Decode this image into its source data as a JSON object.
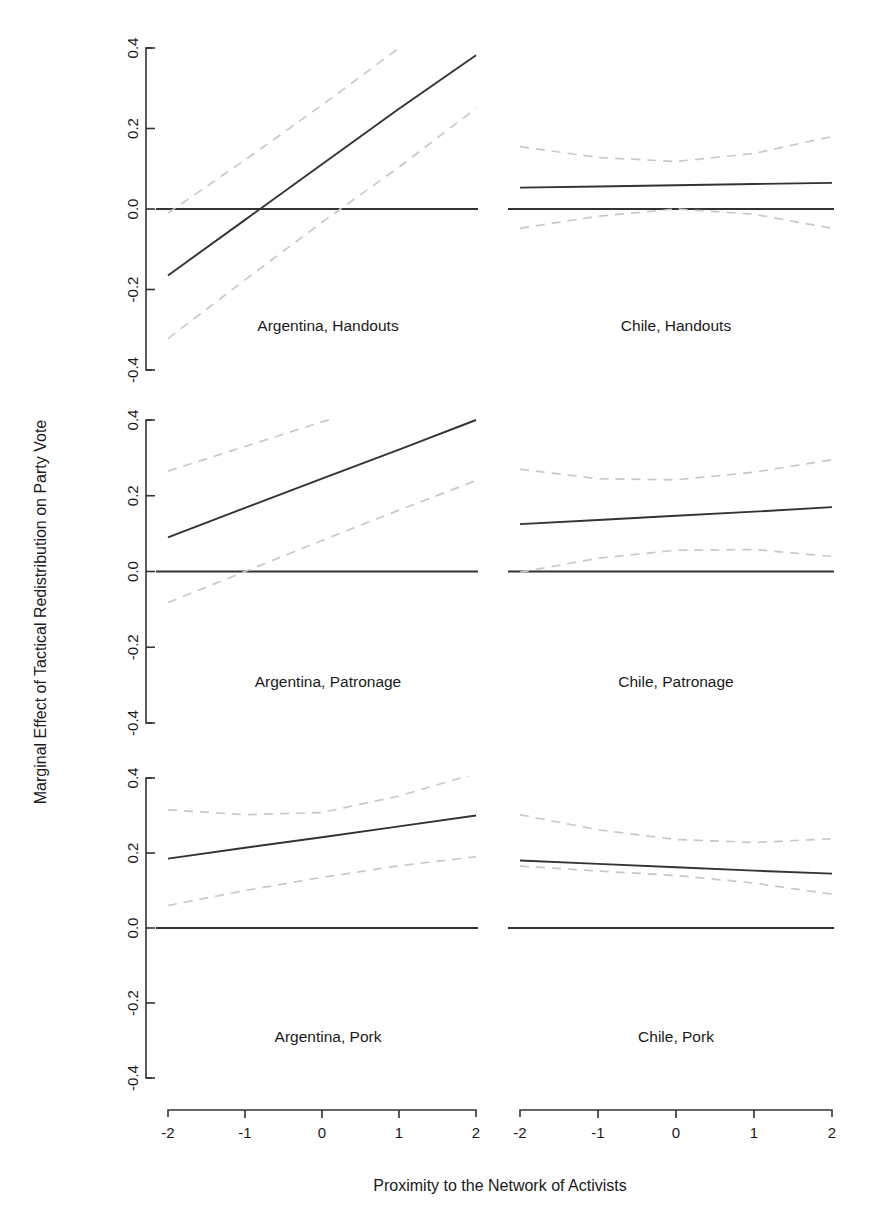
{
  "figure": {
    "axis_titles": {
      "y": "Marginal Effect of Tactical Redistribution on Party Vote",
      "x": "Proximity to the Network of Activists"
    },
    "y_tick_labels": [
      "0.4",
      "0.2",
      "0.0",
      "-0.2",
      "-0.4"
    ],
    "x_tick_labels": [
      "-2",
      "-1",
      "0",
      "1",
      "2"
    ],
    "colors": {
      "line": "#333333",
      "ci": "#c9c9c9",
      "axis": "#333333",
      "background": "#ffffff",
      "text": "#1a1a1a"
    },
    "panel_labels": [
      "Argentina, Handouts",
      "Chile, Handouts",
      "Argentina, Patronage",
      "Chile, Patronage",
      "Argentina, Pork",
      "Chile, Pork"
    ]
  },
  "chart_data": {
    "type": "line",
    "title": "",
    "xlabel": "Proximity to the Network of Activists",
    "ylabel": "Marginal Effect of Tactical Redistribution on Party Vote",
    "xlim": [
      -2,
      2
    ],
    "ylim": [
      -0.4,
      0.4
    ],
    "xticks": [
      -2,
      -1,
      0,
      1,
      2
    ],
    "yticks": [
      -0.4,
      -0.2,
      0.0,
      0.2,
      0.4
    ],
    "grid": false,
    "legend": "none",
    "layout": "3 rows x 2 columns of panels",
    "annotations": [
      "solid line = marginal effect estimate",
      "dashed light-grey lines = 95% confidence interval",
      "solid horizontal line at y = 0 = null reference"
    ],
    "panels": [
      {
        "label": "Argentina, Handouts",
        "row": 1,
        "col": 1,
        "x": [
          -2,
          -1,
          0,
          1,
          2
        ],
        "estimate": [
          -0.165,
          -0.027,
          0.111,
          0.249,
          0.382
        ],
        "ci_upper": [
          -0.01,
          0.122,
          0.258,
          0.4,
          0.545
        ],
        "ci_lower": [
          -0.322,
          -0.176,
          -0.033,
          0.104,
          0.25
        ],
        "zero_crossing": -0.85
      },
      {
        "label": "Chile, Handouts",
        "row": 1,
        "col": 2,
        "x": [
          -2,
          -1,
          0,
          1,
          2
        ],
        "estimate": [
          0.053,
          0.056,
          0.059,
          0.062,
          0.065
        ],
        "ci_upper": [
          0.155,
          0.128,
          0.118,
          0.138,
          0.18
        ],
        "ci_lower": [
          -0.048,
          -0.018,
          0.0,
          -0.013,
          -0.048
        ]
      },
      {
        "label": "Argentina, Patronage",
        "row": 2,
        "col": 1,
        "x": [
          -2,
          -1,
          0,
          1,
          2
        ],
        "estimate": [
          0.09,
          0.168,
          0.245,
          0.322,
          0.4
        ],
        "ci_upper": [
          0.265,
          0.33,
          0.395,
          0.458,
          0.522
        ],
        "ci_lower": [
          -0.082,
          0.0,
          0.082,
          0.162,
          0.24
        ]
      },
      {
        "label": "Chile, Patronage",
        "row": 2,
        "col": 2,
        "x": [
          -2,
          -1,
          0,
          1,
          2
        ],
        "estimate": [
          0.125,
          0.136,
          0.147,
          0.158,
          0.17
        ],
        "ci_upper": [
          0.27,
          0.245,
          0.242,
          0.262,
          0.295
        ],
        "ci_lower": [
          -0.002,
          0.035,
          0.056,
          0.058,
          0.04
        ]
      },
      {
        "label": "Argentina, Pork",
        "row": 3,
        "col": 1,
        "x": [
          -2,
          -1,
          0,
          1,
          2
        ],
        "estimate": [
          0.185,
          0.214,
          0.242,
          0.271,
          0.3
        ],
        "ci_upper": [
          0.315,
          0.302,
          0.308,
          0.352,
          0.412
        ],
        "ci_lower": [
          0.06,
          0.1,
          0.135,
          0.166,
          0.19
        ]
      },
      {
        "label": "Chile, Pork",
        "row": 3,
        "col": 2,
        "x": [
          -2,
          -1,
          0,
          1,
          2
        ],
        "estimate": [
          0.18,
          0.171,
          0.162,
          0.153,
          0.145
        ],
        "ci_upper": [
          0.302,
          0.262,
          0.236,
          0.228,
          0.238
        ],
        "ci_lower": [
          0.165,
          0.152,
          0.14,
          0.12,
          0.09
        ]
      }
    ]
  }
}
